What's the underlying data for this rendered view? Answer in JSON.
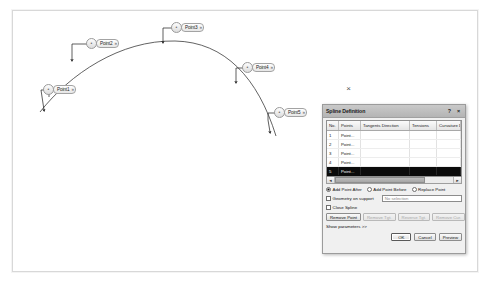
{
  "viewport": {
    "name": "cad-viewport",
    "cursor_marker": "×",
    "points": [
      {
        "label": "Point1",
        "handle_icon": "•",
        "caret": "»"
      },
      {
        "label": "Point2",
        "handle_icon": "•",
        "caret": "»"
      },
      {
        "label": "Point3",
        "handle_icon": "•",
        "caret": "»"
      },
      {
        "label": "Point4",
        "handle_icon": "•",
        "caret": "»"
      },
      {
        "label": "Point5",
        "handle_icon": "•",
        "caret": "»"
      }
    ]
  },
  "dialog": {
    "title": "Spline Definition",
    "help_btn": "?",
    "close_btn": "×",
    "table": {
      "headers": [
        "No.",
        "Points",
        "Tangents Direction",
        "Tensions",
        "Curvature Direc"
      ],
      "rows": [
        {
          "no": "1",
          "point": "Point...",
          "tangent": "",
          "tension": "",
          "curvature": "",
          "selected": false
        },
        {
          "no": "2",
          "point": "Point...",
          "tangent": "",
          "tension": "",
          "curvature": "",
          "selected": false
        },
        {
          "no": "3",
          "point": "Point...",
          "tangent": "",
          "tension": "",
          "curvature": "",
          "selected": false
        },
        {
          "no": "4",
          "point": "Point...",
          "tangent": "",
          "tension": "",
          "curvature": "",
          "selected": false
        },
        {
          "no": "5",
          "point": "Point...",
          "tangent": "",
          "tension": "",
          "curvature": "",
          "selected": true
        }
      ],
      "scroll_left": "◄",
      "scroll_right": "►"
    },
    "insert_mode": {
      "options": [
        {
          "label": "Add Point After",
          "selected": true
        },
        {
          "label": "Add Point Before",
          "selected": false
        },
        {
          "label": "Replace Point",
          "selected": false
        }
      ]
    },
    "geometry_on_support": {
      "label": "Geometry on support",
      "checked": false,
      "value": "No selection"
    },
    "close_spline": {
      "label": "Close Spline",
      "checked": false
    },
    "actions": [
      {
        "label": "Remove Point",
        "disabled": false
      },
      {
        "label": "Remove Tgt.",
        "disabled": true
      },
      {
        "label": "Reverse Tgt.",
        "disabled": true
      },
      {
        "label": "Remove Cur.",
        "disabled": true
      }
    ],
    "show_parameters": "Show parameters >>",
    "footer": [
      {
        "label": "OK",
        "default": true
      },
      {
        "label": "Cancel",
        "default": false
      },
      {
        "label": "Preview",
        "default": false
      }
    ]
  }
}
